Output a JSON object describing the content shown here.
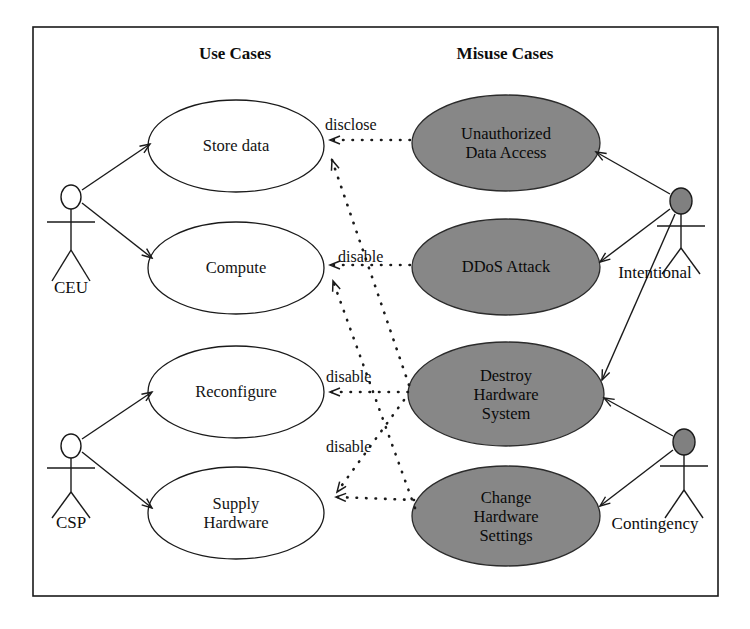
{
  "diagram": {
    "type": "uml-use-case-misuse-case-diagram",
    "frame": {
      "stroke": "#1a1a1a"
    },
    "columns": [
      {
        "id": "use-cases",
        "title": "Use Cases",
        "x": 235,
        "y": 44
      },
      {
        "id": "misuse-cases",
        "title": "Misuse Cases",
        "x": 505,
        "y": 44
      }
    ],
    "colors": {
      "use_case_fill": "#ffffff",
      "misuse_case_fill": "#878787",
      "stroke": "#1a1a1a",
      "actor_head_normal": "#ffffff",
      "actor_head_malicious": "#808080",
      "text": "#111111"
    },
    "use_cases": [
      {
        "id": "store-data",
        "label": "Store data",
        "cx": 236,
        "cy": 146,
        "rx": 88,
        "ry": 46
      },
      {
        "id": "compute",
        "label": "Compute",
        "cx": 236,
        "cy": 268,
        "rx": 88,
        "ry": 46
      },
      {
        "id": "reconfigure",
        "label": "Reconfigure",
        "cx": 236,
        "cy": 392,
        "rx": 88,
        "ry": 46
      },
      {
        "id": "supply-hardware",
        "label": "Supply\nHardware",
        "cx": 236,
        "cy": 513,
        "rx": 88,
        "ry": 46
      }
    ],
    "misuse_cases": [
      {
        "id": "unauthorized-data-access",
        "label": "Unauthorized\nData Access",
        "cx": 506,
        "cy": 143,
        "rx": 94,
        "ry": 48
      },
      {
        "id": "ddos-attack",
        "label": "DDoS Attack",
        "cx": 506,
        "cy": 267,
        "rx": 94,
        "ry": 48
      },
      {
        "id": "destroy-hardware-system",
        "label": "Destroy\nHardware\nSystem",
        "cx": 506,
        "cy": 394,
        "rx": 98,
        "ry": 52
      },
      {
        "id": "change-hardware-settings",
        "label": "Change\nHardware\nSettings",
        "cx": 506,
        "cy": 516,
        "rx": 94,
        "ry": 50
      }
    ],
    "actors": [
      {
        "id": "ceu",
        "label": "CEU",
        "kind": "normal",
        "head_cx": 71,
        "head_cy": 197,
        "label_x": 71,
        "label_y": 288
      },
      {
        "id": "csp",
        "label": "CSP",
        "kind": "normal",
        "head_cx": 71,
        "head_cy": 446,
        "label_x": 71,
        "label_y": 523
      },
      {
        "id": "intentional",
        "label": "Intentional",
        "kind": "malicious",
        "head_cx": 681,
        "head_cy": 201,
        "label_x": 655,
        "label_y": 272
      },
      {
        "id": "contingency",
        "label": "Contingency",
        "kind": "malicious",
        "head_cx": 684,
        "head_cy": 442,
        "label_x": 650,
        "label_y": 523
      }
    ],
    "relations": [
      {
        "id": "rel-disclose-store-data",
        "label": "disclose",
        "label_x": 325,
        "label_y": 118,
        "from": "unauthorized-data-access",
        "to": "store-data",
        "style": "dotted"
      },
      {
        "id": "rel-disable-compute",
        "label": "disable",
        "label_x": 338,
        "label_y": 250,
        "from": "ddos-attack",
        "to": "compute",
        "style": "dotted"
      },
      {
        "id": "rel-disable-reconfigure",
        "label": "disable",
        "label_x": 326,
        "label_y": 370,
        "from": "destroy-hardware-system",
        "to": "reconfigure",
        "style": "dotted"
      },
      {
        "id": "rel-disable-supply-hardware",
        "label": "disable",
        "label_x": 326,
        "label_y": 440,
        "from": "change-hardware-settings",
        "to": "supply-hardware",
        "style": "dotted"
      }
    ],
    "associations": [
      {
        "id": "assoc-ceu-store-data",
        "from": "ceu",
        "to": "store-data"
      },
      {
        "id": "assoc-ceu-compute",
        "from": "ceu",
        "to": "compute"
      },
      {
        "id": "assoc-csp-reconfigure",
        "from": "csp",
        "to": "reconfigure"
      },
      {
        "id": "assoc-csp-supply-hardware",
        "from": "csp",
        "to": "supply-hardware"
      },
      {
        "id": "assoc-intentional-unauthorized",
        "from": "intentional",
        "to": "unauthorized-data-access"
      },
      {
        "id": "assoc-intentional-ddos",
        "from": "intentional",
        "to": "ddos-attack"
      },
      {
        "id": "assoc-intentional-destroy",
        "from": "intentional",
        "to": "destroy-hardware-system"
      },
      {
        "id": "assoc-contingency-destroy",
        "from": "contingency",
        "to": "destroy-hardware-system"
      },
      {
        "id": "assoc-contingency-change",
        "from": "contingency",
        "to": "change-hardware-settings"
      }
    ]
  }
}
